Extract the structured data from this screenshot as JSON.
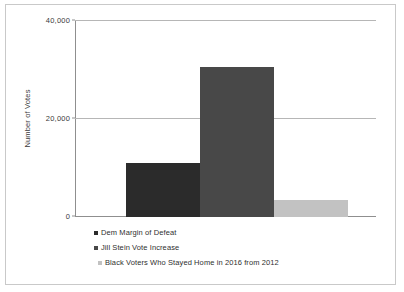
{
  "chart_data": {
    "type": "bar",
    "title": "",
    "xlabel": "",
    "ylabel": "Number of Votes",
    "ylim": [
      0,
      40000
    ],
    "yticks": [
      "0",
      "20,000",
      "40,000"
    ],
    "ytick_values": [
      0,
      20000,
      40000
    ],
    "grid": true,
    "legend_position": "bottom-left",
    "categories": [
      "Dem Margin of Defeat",
      "Jill Stein Vote Increase",
      "Black Voters Who Stayed Home in 2016 from 2012"
    ],
    "values": [
      10900,
      30500,
      3500
    ],
    "colors": [
      "#2b2b2b",
      "#484848",
      "#c2c2c2"
    ],
    "series": [
      {
        "name": "Dem Margin of Defeat",
        "value": 10900,
        "color": "#2b2b2b"
      },
      {
        "name": "Jill Stein Vote Increase",
        "value": 30500,
        "color": "#484848"
      },
      {
        "name": "Black Voters Who Stayed Home in 2016 from 2012",
        "value": 3500,
        "color": "#c2c2c2"
      }
    ]
  },
  "legend": {
    "items": [
      {
        "label": "Dem Margin of Defeat",
        "color": "#2b2b2b"
      },
      {
        "label": "Jill Stein Vote Increase",
        "color": "#484848"
      },
      {
        "label": "Black Voters Who Stayed Home in 2016 from 2012",
        "color": "#c2c2c2"
      }
    ]
  },
  "axis": {
    "y_title": "Number of Votes",
    "tick_top": "40,000",
    "tick_mid": "20,000",
    "tick_bottom": "0"
  }
}
